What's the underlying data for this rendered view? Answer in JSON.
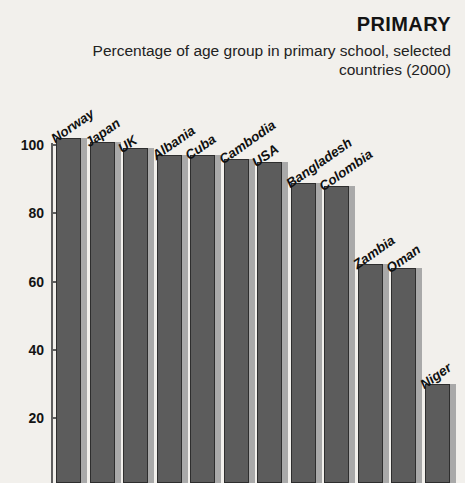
{
  "header": {
    "title": "PRIMARY",
    "subtitle": "Percentage of age group in primary school, selected countries (2000)"
  },
  "chart_data": {
    "type": "bar",
    "title": "PRIMARY",
    "subtitle": "Percentage of age group in primary school, selected countries (2000)",
    "xlabel": "",
    "ylabel": "",
    "ylim": [
      0,
      105
    ],
    "grid": false,
    "legend": null,
    "y_ticks": [
      100,
      80,
      60,
      40,
      20
    ],
    "categories": [
      "Norway",
      "Japan",
      "UK",
      "Albania",
      "Cuba",
      "Cambodia",
      "USA",
      "Bangladesh",
      "Colombia",
      "Zambia",
      "Oman",
      "Niger"
    ],
    "values": [
      102,
      101,
      99,
      97,
      97,
      96,
      95,
      89,
      88,
      65,
      64,
      30
    ],
    "colors": {
      "bar": "#5c5c5c",
      "bar_outline": "#2e2e2e",
      "bar_shadow": "#a9a9a9",
      "background": "#f2f0ec",
      "axis": "#5e5e5e",
      "text": "#141414"
    }
  }
}
